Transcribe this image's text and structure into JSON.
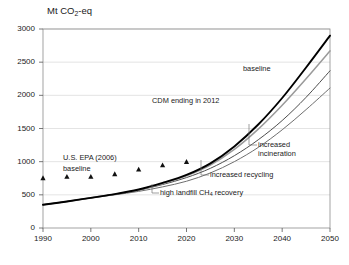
{
  "chart_data": {
    "type": "line",
    "title": "Mt CO2-eq",
    "title_parts": {
      "prefix": "Mt CO",
      "sub": "2",
      "suffix": "-eq"
    },
    "xlabel": "",
    "ylabel": "Mt CO2-eq",
    "xlim": [
      1990,
      2050
    ],
    "ylim": [
      0,
      3000
    ],
    "grid": true,
    "legend_position": "inline-annotations",
    "x_ticks": [
      1990,
      2000,
      2010,
      2020,
      2030,
      2040,
      2050
    ],
    "x_tick_labels": [
      "1990",
      "2000",
      "2010",
      "2020",
      "2030",
      "2040",
      "2050"
    ],
    "y_ticks": [
      0,
      500,
      1000,
      1500,
      2000,
      2500,
      3000
    ],
    "y_tick_labels": [
      "0",
      "500",
      "1000",
      "1500",
      "2000",
      "2500",
      "3000"
    ],
    "x": [
      1990,
      1995,
      2000,
      2005,
      2010,
      2015,
      2020,
      2025,
      2030,
      2035,
      2040,
      2045,
      2050
    ],
    "series": [
      {
        "name": "baseline",
        "color": "#000000",
        "width": 1.9,
        "values": [
          350,
          400,
          455,
          510,
          580,
          680,
          800,
          975,
          1230,
          1560,
          1960,
          2420,
          2900
        ]
      },
      {
        "name": "CDM ending in 2012",
        "color": "#9a9a9a",
        "width": 1.5,
        "values": [
          350,
          400,
          455,
          510,
          578,
          672,
          788,
          950,
          1185,
          1490,
          1850,
          2250,
          2670
        ]
      },
      {
        "name": "increased incineration",
        "color": "#4d4d4d",
        "width": 1.0,
        "values": [
          350,
          400,
          455,
          508,
          570,
          655,
          760,
          900,
          1090,
          1330,
          1620,
          1970,
          2370
        ]
      },
      {
        "name": "increased recycling",
        "color": "#6f6f6f",
        "width": 1.0,
        "values": [
          350,
          400,
          452,
          500,
          552,
          620,
          705,
          830,
          1000,
          1215,
          1480,
          1785,
          2110
        ]
      }
    ],
    "markers": {
      "name": "U.S. EPA (2006) baseline",
      "shape": "triangle",
      "color": "#111111",
      "x": [
        1990,
        1995,
        2000,
        2005,
        2010,
        2015,
        2020
      ],
      "values": [
        755,
        775,
        775,
        815,
        885,
        950,
        1000
      ]
    },
    "annotations": [
      {
        "id": "baseline",
        "text": "baseline",
        "x": 243,
        "y": 70,
        "leader": false
      },
      {
        "id": "cdm",
        "text": "CDM ending in 2012",
        "x": 160,
        "y": 102,
        "leader": false
      },
      {
        "id": "increased-incineration",
        "text_line1": "increased",
        "text_line2": "incineration",
        "x": 272,
        "y": 147,
        "leader": true
      },
      {
        "id": "increased-recycling",
        "text": "increased recycling",
        "x": 222,
        "y": 176,
        "leader": true
      },
      {
        "id": "high-landfill",
        "text_prefix": "high landfill CH",
        "text_sub": "4",
        "text_suffix": " recovery",
        "x": 172,
        "y": 194,
        "leader": true
      },
      {
        "id": "epa-line1",
        "text": "U.S. EPA (2006)",
        "x": 65,
        "y": 159,
        "leader": false
      },
      {
        "id": "epa-line2",
        "text": "baseline",
        "x": 65,
        "y": 170,
        "leader": false
      }
    ]
  }
}
